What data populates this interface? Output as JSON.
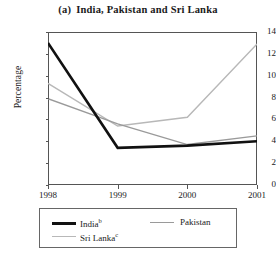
{
  "chart_data": {
    "type": "line",
    "title_prefix": "(a)",
    "title_text": "India, Pakistan and Sri Lanka",
    "xlabel": "",
    "ylabel": "Percentage",
    "categories": [
      "1998",
      "1999",
      "2000",
      "2001"
    ],
    "x": [
      1998,
      1999,
      2000,
      2001
    ],
    "ylim": [
      0,
      14
    ],
    "xlim": [
      1998,
      2001
    ],
    "yticks": [
      "14",
      "12",
      "10",
      "8",
      "6",
      "4",
      "2",
      "0"
    ],
    "ytick_values": [
      14,
      12,
      10,
      8,
      6,
      4,
      2,
      0
    ],
    "grid": false,
    "legend_position": "below-plot",
    "series": [
      {
        "name": "India",
        "name_superscript": "b",
        "label": "India",
        "color": "#111111",
        "width": 2.6,
        "values": [
          13.0,
          3.4,
          3.6,
          4.0
        ]
      },
      {
        "name": "Pakistan",
        "name_superscript": "",
        "label": "Pakistan",
        "color": "#9a9a9a",
        "width": 1.4,
        "values": [
          7.9,
          5.6,
          3.7,
          4.5
        ]
      },
      {
        "name": "Sri Lanka",
        "name_superscript": "c",
        "label": "Sri Lanka",
        "color": "#b8b8b8",
        "width": 1.4,
        "values": [
          9.3,
          5.4,
          6.2,
          12.9
        ]
      }
    ]
  }
}
